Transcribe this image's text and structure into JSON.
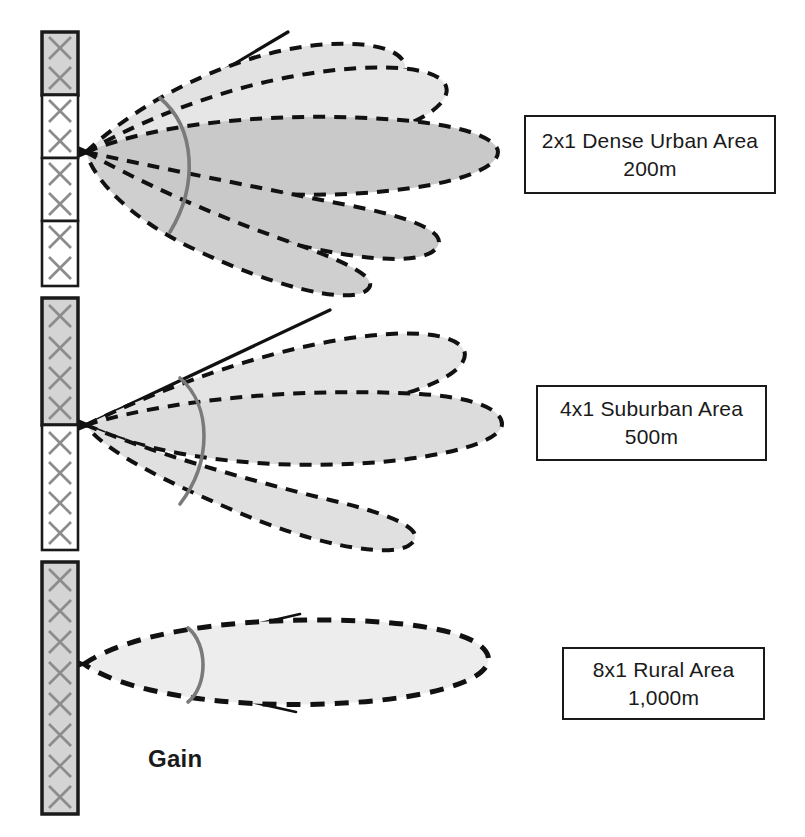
{
  "figure": {
    "title_text": "Gain",
    "background": "#ffffff",
    "ink_color": "#1a1a1a",
    "arc_color": "#7a7a7a",
    "element_x_color": "#8c8c8c",
    "panel_active_fill": "#d4d4d4",
    "panel_inactive_fill": "#ffffff",
    "lobe_outline_color": "#111111"
  },
  "scenarios": [
    {
      "id": "dense-urban",
      "label_line1": "2x1 Dense Urban Area",
      "label_line2": "200m",
      "config": "2x1",
      "environment": "Dense Urban Area",
      "cell_radius": "200m",
      "active_elements": 2,
      "total_elements": 8,
      "lobe_count": 4,
      "beamwidth_relative": "widest",
      "gain_relative": "lowest",
      "label_box": {
        "x": 524,
        "y": 115,
        "width": 252,
        "height": 79
      },
      "array": {
        "x": 42,
        "y": 32,
        "width": 36,
        "height": 254,
        "cells": 4,
        "elements_per_cell": 2,
        "active_cells": [
          0
        ]
      },
      "beam": {
        "apex_x": 86,
        "apex_y": 152
      }
    },
    {
      "id": "suburban",
      "label_line1": "4x1 Suburban Area",
      "label_line2": "500m",
      "config": "4x1",
      "environment": "Suburban Area",
      "cell_radius": "500m",
      "active_elements": 4,
      "total_elements": 8,
      "lobe_count": 3,
      "beamwidth_relative": "medium",
      "gain_relative": "medium",
      "label_box": {
        "x": 536,
        "y": 385,
        "width": 231,
        "height": 76
      },
      "array": {
        "x": 42,
        "y": 298,
        "width": 36,
        "height": 252,
        "cells": 2,
        "elements_per_cell": 4,
        "active_cells": [
          0
        ]
      },
      "beam": {
        "apex_x": 86,
        "apex_y": 425
      }
    },
    {
      "id": "rural",
      "label_line1": "8x1 Rural Area",
      "label_line2": "1,000m",
      "config": "8x1",
      "environment": "Rural Area",
      "cell_radius": "1,000m",
      "active_elements": 8,
      "total_elements": 8,
      "lobe_count": 1,
      "beamwidth_relative": "narrowest",
      "gain_relative": "highest",
      "label_box": {
        "x": 562,
        "y": 647,
        "width": 203,
        "height": 73
      },
      "array": {
        "x": 42,
        "y": 562,
        "width": 36,
        "height": 252,
        "cells": 1,
        "elements_per_cell": 8,
        "active_cells": [
          0
        ]
      },
      "beam": {
        "apex_x": 86,
        "apex_y": 664
      }
    }
  ],
  "gain_annotation": {
    "text": "Gain",
    "x": 148,
    "y": 745
  },
  "legend_semantics": {
    "x_symbol": "cross-polarized-antenna-element",
    "gray_panel": "active-antenna-sub-array",
    "white_panel": "inactive-antenna-sub-array",
    "dashed_outline": "radiation-pattern-lobe",
    "gray_arc": "half-power-beamwidth-marker",
    "solid_rays": "beamwidth-boundary-rays"
  }
}
